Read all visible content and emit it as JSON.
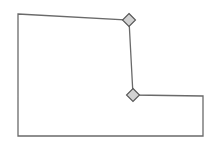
{
  "canvas": {
    "name": "polygon-vertex-editor",
    "width": 216,
    "height": 146,
    "background_color": "#ffffff"
  },
  "shape": {
    "name": "L-shaped polygon",
    "type": "closed-polygon",
    "fill_color": "none",
    "stroke_color": "#6a6a6a",
    "stroke_width": 1.3,
    "points_attr": "18,14 129,20 133,95 203,96 203,136 18,136",
    "vertices": [
      {
        "id": "v1",
        "label": "top-left-corner",
        "x": 18,
        "y": 14,
        "handle": false
      },
      {
        "id": "v2",
        "label": "top-right-node",
        "x": 129,
        "y": 20,
        "handle": true
      },
      {
        "id": "v3",
        "label": "inner-elbow-node",
        "x": 133,
        "y": 95,
        "handle": true
      },
      {
        "id": "v4",
        "label": "right-step-corner",
        "x": 203,
        "y": 96,
        "handle": false
      },
      {
        "id": "v5",
        "label": "bottom-right-corner",
        "x": 203,
        "y": 136,
        "handle": false
      },
      {
        "id": "v6",
        "label": "bottom-left-corner",
        "x": 18,
        "y": 136,
        "handle": false
      }
    ]
  },
  "handles": {
    "shape": "diamond",
    "size": 13,
    "fill_color": "#d2d2d2",
    "stroke_color": "#555555",
    "stroke_width": 1.1,
    "items": [
      {
        "id": "handle-1",
        "name": "vertex-handle-top",
        "x": 129,
        "y": 20,
        "points_attr": "129,13.5 135.5,20 129,26.5 122.5,20"
      },
      {
        "id": "handle-2",
        "name": "vertex-handle-elbow",
        "x": 133,
        "y": 95,
        "points_attr": "133,88.5 139.5,95 133,101.5 126.5,95"
      }
    ]
  },
  "edges": [
    {
      "id": "e1",
      "name": "edge-top",
      "from": "v1",
      "to": "v2",
      "x1": 18,
      "y1": 14,
      "x2": 129,
      "y2": 20
    },
    {
      "id": "e2",
      "name": "edge-vertical-mid",
      "from": "v2",
      "to": "v3",
      "x1": 129,
      "y1": 20,
      "x2": 133,
      "y2": 95
    },
    {
      "id": "e3",
      "name": "edge-step-top",
      "from": "v3",
      "to": "v4",
      "x1": 133,
      "y1": 95,
      "x2": 203,
      "y2": 96
    },
    {
      "id": "e4",
      "name": "edge-right",
      "from": "v4",
      "to": "v5",
      "x1": 203,
      "y1": 96,
      "x2": 203,
      "y2": 136
    },
    {
      "id": "e5",
      "name": "edge-bottom",
      "from": "v5",
      "to": "v6",
      "x1": 203,
      "y1": 136,
      "x2": 18,
      "y2": 136
    },
    {
      "id": "e6",
      "name": "edge-left",
      "from": "v6",
      "to": "v1",
      "x1": 18,
      "y1": 136,
      "x2": 18,
      "y2": 14
    }
  ]
}
